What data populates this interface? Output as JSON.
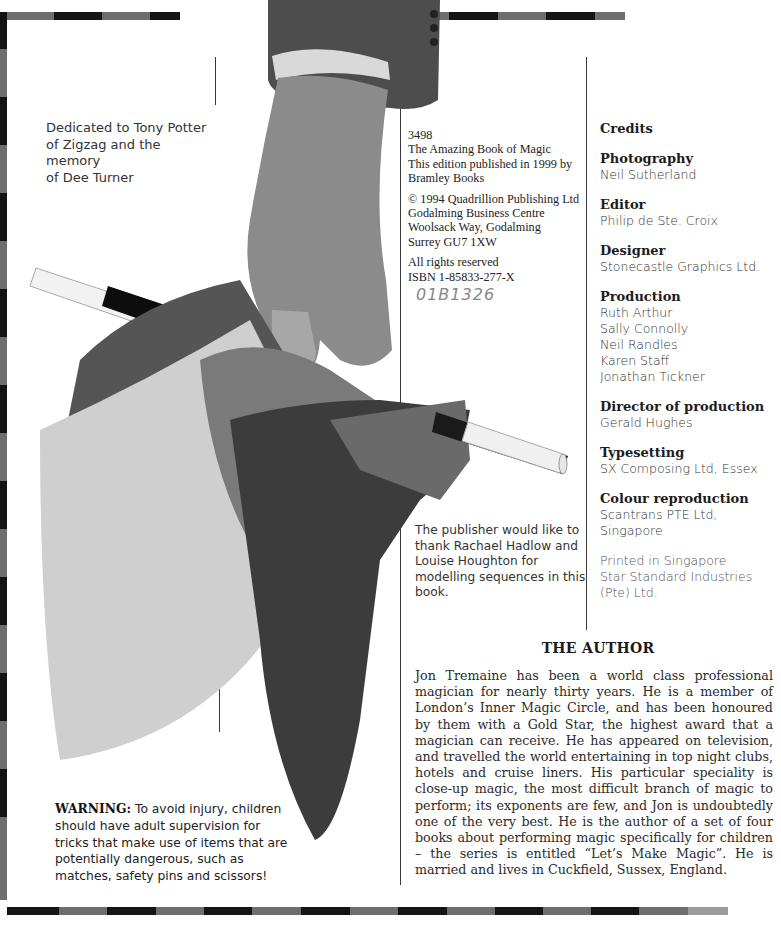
{
  "page": {
    "type": "book front matter page",
    "border_colors": {
      "dark": "#141414",
      "grey": "#6e6e6e"
    }
  },
  "dedication": {
    "lines": [
      "Dedicated to Tony Potter",
      "of Zigzag and the memory",
      "of Dee Turner"
    ]
  },
  "imprint": {
    "block1": [
      "3498",
      "The Amazing Book of Magic",
      "This edition published in 1999 by",
      "Bramley Books"
    ],
    "block2": [
      "© 1994 Quadrillion Publishing Ltd",
      "Godalming Business Centre",
      "Woolsack Way, Godalming",
      "Surrey GU7 1XW"
    ],
    "block3": [
      "All rights reserved",
      "ISBN 1-85833-277-X"
    ],
    "handwritten_number": "01B1326"
  },
  "acknowledgement": {
    "lines": [
      "The publisher would like to",
      "thank Rachael Hadlow and",
      "Louise Houghton for",
      "modelling sequences in this",
      "book."
    ]
  },
  "credits": {
    "title": "Credits",
    "sections": [
      {
        "heading": "Photography",
        "names": [
          "Neil Sutherland"
        ]
      },
      {
        "heading": "Editor",
        "names": [
          "Philip de Ste. Croix"
        ]
      },
      {
        "heading": "Designer",
        "names": [
          "Stonecastle Graphics Ltd."
        ]
      },
      {
        "heading": "Production",
        "names": [
          "Ruth Arthur",
          "Sally Connolly",
          "Neil Randles",
          "Karen Staff",
          "Jonathan Tickner"
        ]
      },
      {
        "heading": "Director of production",
        "names": [
          "Gerald Hughes"
        ]
      },
      {
        "heading": "Typesetting",
        "names": [
          "SX Composing Ltd, Essex"
        ]
      },
      {
        "heading": "Colour reproduction",
        "names": [
          "Scantrans PTE Ltd,",
          "Singapore"
        ]
      }
    ],
    "printed": [
      "Printed in Singapore",
      "Star Standard Industries",
      "(Pte) Ltd."
    ]
  },
  "author": {
    "title": "THE AUTHOR",
    "bio": "Jon Tremaine has been a world class professional magician for nearly thirty years. He is a member of London’s Inner Magic Circle, and has been honoured by them with a Gold Star, the highest award that a magician can receive. He has appeared on television, and travelled the world entertaining in top night clubs, hotels and cruise liners. His particular speciality is close-up magic, the most difficult branch of magic to perform; its exponents are few, and Jon is undoubtedly one of the very best. He is the author of a set of four books about performing magic specifically for children – the series is entitled “Let’s Make Magic”. He is married and lives in Cuckfield, Sussex, England."
  },
  "warning": {
    "label": "WARNING:",
    "text": " To avoid injury, children should have adult supervision for tricks that make use of items that are potentially dangerous, such as matches, safety pins and scissors!"
  },
  "photo": {
    "description": "hand holding magic wand and silk scarves"
  }
}
